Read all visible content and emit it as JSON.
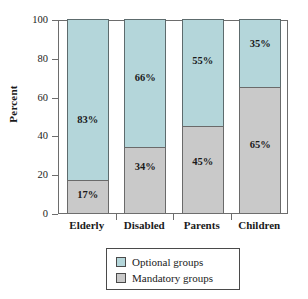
{
  "chart_data": {
    "type": "bar",
    "subtype": "stacked-100-percent",
    "title": "",
    "xlabel": "",
    "ylabel": "Percent",
    "ylim": [
      0,
      100
    ],
    "yticks": [
      0,
      20,
      40,
      60,
      80,
      100
    ],
    "ytick_labels": [
      "0",
      "20",
      "40",
      "60",
      "80",
      "100"
    ],
    "grid": false,
    "categories": [
      "Elderly",
      "Disabled",
      "Parents",
      "Children"
    ],
    "series": [
      {
        "name": "Optional groups",
        "color": "#b4d6da",
        "values": [
          83,
          66,
          55,
          35
        ],
        "labels": [
          "83%",
          "66%",
          "55%",
          "35%"
        ]
      },
      {
        "name": "Mandatory groups",
        "color": "#c9c9c9",
        "values": [
          17,
          34,
          45,
          65
        ],
        "labels": [
          "17%",
          "34%",
          "45%",
          "65%"
        ]
      }
    ],
    "legend": {
      "position": "bottom",
      "entries": [
        {
          "label": "Optional groups",
          "color": "#b4d6da"
        },
        {
          "label": "Mandatory groups",
          "color": "#c9c9c9"
        }
      ]
    }
  }
}
